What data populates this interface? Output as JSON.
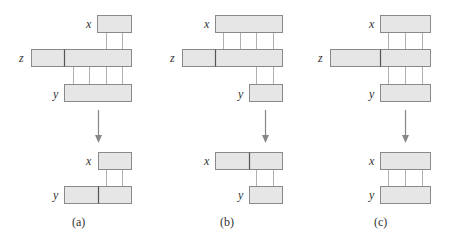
{
  "colors": {
    "box_fill": "#e6e6e6",
    "box_stroke": "#8a8a8a",
    "divider": "#555555",
    "connector": "#b0b0b0",
    "arrow": "#888888",
    "text": "#333333"
  },
  "panels": [
    {
      "caption": "(a)",
      "caption_pos": [
        72,
        216
      ],
      "top": {
        "boxes": [
          {
            "name": "x",
            "x": 97,
            "y": 15,
            "w": 34,
            "h": 17,
            "dividers": []
          },
          {
            "name": "z",
            "x": 31,
            "y": 49,
            "w": 100,
            "h": 17,
            "dividers": [
              64
            ]
          },
          {
            "name": "y",
            "x": 64,
            "y": 84,
            "w": 67,
            "h": 17,
            "dividers": []
          }
        ],
        "connectors": [
          {
            "x": 106,
            "y1": 32,
            "y2": 49
          },
          {
            "x": 122,
            "y1": 32,
            "y2": 49
          },
          {
            "x": 73,
            "y1": 66,
            "y2": 84
          },
          {
            "x": 89,
            "y1": 66,
            "y2": 84
          },
          {
            "x": 106,
            "y1": 66,
            "y2": 84
          },
          {
            "x": 122,
            "y1": 66,
            "y2": 84
          }
        ],
        "labels": [
          {
            "text": "x",
            "x": 86,
            "y": 18
          },
          {
            "text": "z",
            "x": 19,
            "y": 52
          },
          {
            "text": "y",
            "x": 53,
            "y": 88
          }
        ]
      },
      "arrow": {
        "x": 98,
        "y1": 110,
        "y2": 143
      },
      "bottom": {
        "boxes": [
          {
            "name": "x",
            "x": 98,
            "y": 152,
            "w": 33,
            "h": 17,
            "dividers": []
          },
          {
            "name": "y",
            "x": 64,
            "y": 186,
            "w": 67,
            "h": 17,
            "dividers": [
              98
            ]
          }
        ],
        "connectors": [
          {
            "x": 106,
            "y1": 169,
            "y2": 186
          },
          {
            "x": 122,
            "y1": 169,
            "y2": 186
          }
        ],
        "labels": [
          {
            "text": "x",
            "x": 86,
            "y": 155
          },
          {
            "text": "y",
            "x": 53,
            "y": 189
          }
        ]
      }
    },
    {
      "caption": "(b)",
      "caption_pos": [
        220,
        216
      ],
      "top": {
        "boxes": [
          {
            "name": "x",
            "x": 215,
            "y": 15,
            "w": 67,
            "h": 17,
            "dividers": []
          },
          {
            "name": "z",
            "x": 182,
            "y": 49,
            "w": 100,
            "h": 17,
            "dividers": [
              215
            ]
          },
          {
            "name": "y",
            "x": 249,
            "y": 84,
            "w": 33,
            "h": 17,
            "dividers": []
          }
        ],
        "connectors": [
          {
            "x": 223,
            "y1": 32,
            "y2": 49
          },
          {
            "x": 240,
            "y1": 32,
            "y2": 49
          },
          {
            "x": 256,
            "y1": 32,
            "y2": 49
          },
          {
            "x": 273,
            "y1": 32,
            "y2": 49
          },
          {
            "x": 256,
            "y1": 66,
            "y2": 84
          },
          {
            "x": 273,
            "y1": 66,
            "y2": 84
          }
        ],
        "labels": [
          {
            "text": "x",
            "x": 204,
            "y": 18
          },
          {
            "text": "z",
            "x": 170,
            "y": 52
          },
          {
            "text": "y",
            "x": 238,
            "y": 88
          }
        ]
      },
      "arrow": {
        "x": 265,
        "y1": 110,
        "y2": 143
      },
      "bottom": {
        "boxes": [
          {
            "name": "x",
            "x": 215,
            "y": 152,
            "w": 67,
            "h": 17,
            "dividers": [
              249
            ]
          },
          {
            "name": "y",
            "x": 249,
            "y": 186,
            "w": 33,
            "h": 17,
            "dividers": []
          }
        ],
        "connectors": [
          {
            "x": 256,
            "y1": 169,
            "y2": 186
          },
          {
            "x": 273,
            "y1": 169,
            "y2": 186
          }
        ],
        "labels": [
          {
            "text": "x",
            "x": 204,
            "y": 155
          },
          {
            "text": "y",
            "x": 238,
            "y": 189
          }
        ]
      }
    },
    {
      "caption": "(c)",
      "caption_pos": [
        374,
        216
      ],
      "top": {
        "boxes": [
          {
            "name": "x",
            "x": 380,
            "y": 15,
            "w": 50,
            "h": 17,
            "dividers": []
          },
          {
            "name": "z",
            "x": 330,
            "y": 49,
            "w": 100,
            "h": 17,
            "dividers": [
              380
            ]
          },
          {
            "name": "y",
            "x": 380,
            "y": 84,
            "w": 50,
            "h": 17,
            "dividers": []
          }
        ],
        "connectors": [
          {
            "x": 388,
            "y1": 32,
            "y2": 49
          },
          {
            "x": 405,
            "y1": 32,
            "y2": 49
          },
          {
            "x": 422,
            "y1": 32,
            "y2": 49
          },
          {
            "x": 388,
            "y1": 66,
            "y2": 84
          },
          {
            "x": 405,
            "y1": 66,
            "y2": 84
          },
          {
            "x": 422,
            "y1": 66,
            "y2": 84
          }
        ],
        "labels": [
          {
            "text": "x",
            "x": 369,
            "y": 18
          },
          {
            "text": "z",
            "x": 318,
            "y": 52
          },
          {
            "text": "y",
            "x": 369,
            "y": 88
          }
        ]
      },
      "arrow": {
        "x": 405,
        "y1": 110,
        "y2": 143
      },
      "bottom": {
        "boxes": [
          {
            "name": "x",
            "x": 380,
            "y": 152,
            "w": 50,
            "h": 17,
            "dividers": []
          },
          {
            "name": "y",
            "x": 380,
            "y": 186,
            "w": 50,
            "h": 17,
            "dividers": []
          }
        ],
        "connectors": [
          {
            "x": 388,
            "y1": 169,
            "y2": 186
          },
          {
            "x": 405,
            "y1": 169,
            "y2": 186
          },
          {
            "x": 422,
            "y1": 169,
            "y2": 186
          }
        ],
        "labels": [
          {
            "text": "x",
            "x": 369,
            "y": 155
          },
          {
            "text": "y",
            "x": 369,
            "y": 189
          }
        ]
      }
    }
  ]
}
